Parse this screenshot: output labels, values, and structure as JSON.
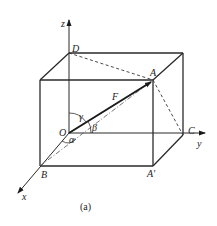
{
  "figure": {
    "caption": "(a)",
    "axes": {
      "x": "x",
      "y": "y",
      "z": "z"
    },
    "points": {
      "origin": "O",
      "A": "A",
      "A_prime": "A'",
      "B": "B",
      "C": "C",
      "D": "D"
    },
    "vector": "F",
    "angles": {
      "alpha": "α",
      "beta": "β",
      "gamma": "γ"
    }
  }
}
